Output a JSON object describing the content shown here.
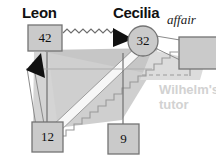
{
  "diagram": {
    "colors": {
      "background": "#ffffff",
      "node_fill": "#c9c9c9",
      "node_stroke": "#777777",
      "shade_dark": "#c2c2c2",
      "shade_mid": "#d0d0d0",
      "shade_light": "#dedede",
      "ribbon": "#f6f6f6",
      "line": "#6e6e6e",
      "arrow": "#111111",
      "text": "#111111",
      "muted_text": "#d2d2d2"
    },
    "labels": {
      "leon": "Leon",
      "cecilia": "Cecilia",
      "affair": "affair",
      "wilhelm_line1": "Wilhelm's",
      "wilhelm_line2": "tutor"
    },
    "nodes": [
      {
        "id": "leon",
        "shape": "rect",
        "value": "42",
        "x": 28,
        "y": 25,
        "w": 34,
        "h": 26
      },
      {
        "id": "cecilia",
        "shape": "circle",
        "value": "32",
        "cx": 143,
        "cy": 41,
        "r": 15
      },
      {
        "id": "bottom-left",
        "shape": "rect",
        "value": "12",
        "x": 32,
        "y": 122,
        "w": 31,
        "h": 30
      },
      {
        "id": "bottom-right",
        "shape": "rect",
        "value": "9",
        "x": 108,
        "y": 124,
        "w": 31,
        "h": 30
      },
      {
        "id": "affair-box",
        "shape": "rect",
        "value": "",
        "x": 179,
        "y": 37,
        "w": 38,
        "h": 32
      }
    ],
    "edges": [
      {
        "id": "leon-to-cecilia",
        "style": "zigzag",
        "from": "leon",
        "to": "cecilia",
        "arrow": true
      },
      {
        "id": "bottomleft-to-leon",
        "style": "line",
        "from": "bottom-left",
        "to": "leon",
        "arrow": true
      },
      {
        "id": "bottomleft-to-cecilia",
        "style": "ribbon",
        "from": "bottom-left",
        "to": "cecilia",
        "arrow": false
      },
      {
        "id": "stepped-edge",
        "style": "stair",
        "from": "bottom-left",
        "to": "affair-box",
        "arrow": false
      },
      {
        "id": "cecilia-to-affair",
        "style": "double-line",
        "from": "cecilia",
        "to": "affair-box",
        "arrow": false
      },
      {
        "id": "affair-dashed",
        "style": "dashed",
        "from": "affair-box",
        "to": "stepped-edge",
        "arrow": false
      },
      {
        "id": "leon-vertical",
        "style": "line",
        "from": "leon",
        "to": "bottom-left",
        "arrow": false
      },
      {
        "id": "cecilia-vertical",
        "style": "line",
        "from": "cecilia",
        "to": "bottom-right",
        "arrow": false
      }
    ]
  }
}
